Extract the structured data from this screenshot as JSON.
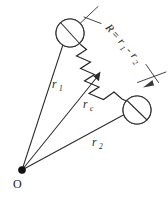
{
  "figure": {
    "kind": "physics-vector-diagram",
    "background_color": "#ffffff",
    "line_color": "#2b2b2b",
    "annotation_color": "#3a3a3a",
    "text_color": "#1a1a1a"
  },
  "origin": {
    "label": "O",
    "x": 22,
    "y": 170,
    "marker": "filled-dot"
  },
  "particles": [
    {
      "id": "particle-1",
      "name": "upper-left-particle",
      "cx": 70,
      "cy": 33,
      "r": 14,
      "shade_side": "left",
      "shade_color": "#9a9a9a"
    },
    {
      "id": "particle-2",
      "name": "lower-right-particle",
      "cx": 137,
      "cy": 110,
      "r": 14,
      "shade_side": "right",
      "shade_color": "#9a9a9a"
    }
  ],
  "spring": {
    "name": "connecting-spring",
    "from_particle": "particle-1",
    "to_particle": "particle-2",
    "coils": 7
  },
  "vectors": [
    {
      "id": "r1",
      "label_base": "r",
      "label_sub": "1",
      "label_text": "r1",
      "from": "O",
      "to": "particle-1",
      "tip_x": 66,
      "tip_y": 38,
      "label_x": 52,
      "label_y": 88
    },
    {
      "id": "rc",
      "label_base": "r",
      "label_sub": "c",
      "label_text": "rc",
      "from": "O",
      "to": "spring-midpoint",
      "tip_x": 100,
      "tip_y": 73,
      "label_x": 83,
      "label_y": 108
    },
    {
      "id": "r2",
      "label_base": "r",
      "label_sub": "2",
      "label_text": "r2",
      "from": "O",
      "to": "particle-2",
      "tip_x": 131,
      "tip_y": 111,
      "label_x": 92,
      "label_y": 146
    }
  ],
  "dimension": {
    "name": "separation-annotation",
    "equation_lead": "R",
    "equals": "=",
    "term1_base": "r",
    "term1_sub": "1",
    "minus": "-",
    "term2_base": "r",
    "term2_sub": "2",
    "full_text": "R = r1 - r2",
    "rotation_deg": 48,
    "leader_from": "particle-1",
    "leader_to": "particle-2"
  }
}
